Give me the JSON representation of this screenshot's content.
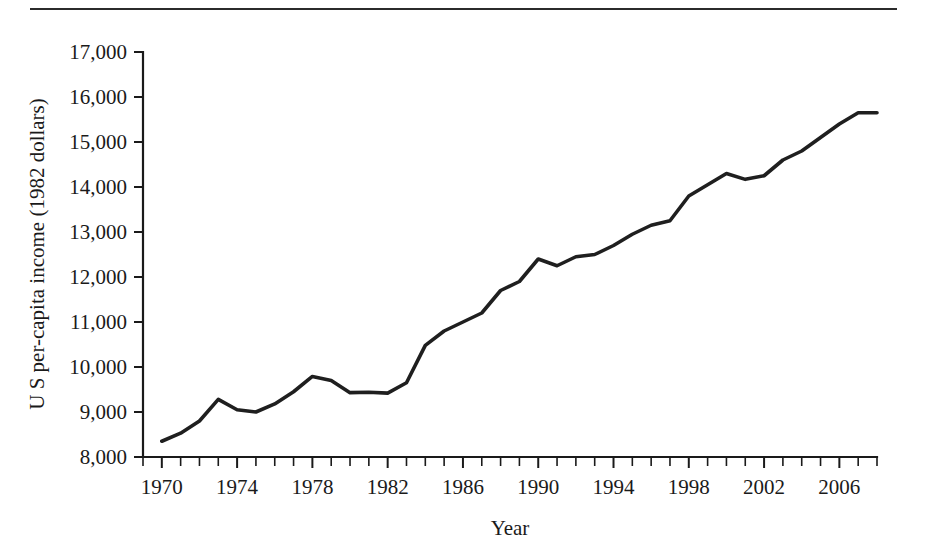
{
  "figure": {
    "top_rule": true
  },
  "chart_data": {
    "type": "line",
    "title": "",
    "xlabel": "Year",
    "ylabel": "U S per-capita income (1982 dollars)",
    "xlim": [
      1969,
      2008
    ],
    "ylim": [
      8000,
      17000
    ],
    "grid": false,
    "legend": null,
    "x_tick_labels": [
      "1970",
      "1974",
      "1978",
      "1982",
      "1986",
      "1990",
      "1994",
      "1998",
      "2002",
      "2006"
    ],
    "x_tick_values": [
      1970,
      1974,
      1978,
      1982,
      1986,
      1990,
      1994,
      1998,
      2002,
      2006
    ],
    "x_minor_tick_step": 1,
    "y_tick_labels": [
      "8,000",
      "9,000",
      "10,000",
      "11,000",
      "12,000",
      "13,000",
      "14,000",
      "15,000",
      "16,000",
      "17,000"
    ],
    "y_tick_values": [
      8000,
      9000,
      10000,
      11000,
      12000,
      13000,
      14000,
      15000,
      16000,
      17000
    ],
    "series": [
      {
        "name": "U S per-capita income",
        "color": "#1f1f1f",
        "x": [
          1970,
          1971,
          1972,
          1973,
          1974,
          1975,
          1976,
          1977,
          1978,
          1979,
          1980,
          1981,
          1982,
          1983,
          1984,
          1985,
          1986,
          1987,
          1988,
          1989,
          1990,
          1991,
          1992,
          1993,
          1994,
          1995,
          1996,
          1997,
          1998,
          1999,
          2000,
          2001,
          2002,
          2003,
          2004,
          2005,
          2006,
          2007,
          2008
        ],
        "values": [
          8350,
          8530,
          8800,
          9280,
          9050,
          9000,
          9180,
          9450,
          9790,
          9700,
          9430,
          9440,
          9420,
          9650,
          10480,
          10800,
          11000,
          11200,
          11700,
          11900,
          12400,
          12250,
          12450,
          12500,
          12700,
          12950,
          13150,
          13250,
          13800,
          14050,
          14300,
          14170,
          14250,
          14600,
          14800,
          15100,
          15400,
          15650,
          15650
        ]
      }
    ]
  }
}
